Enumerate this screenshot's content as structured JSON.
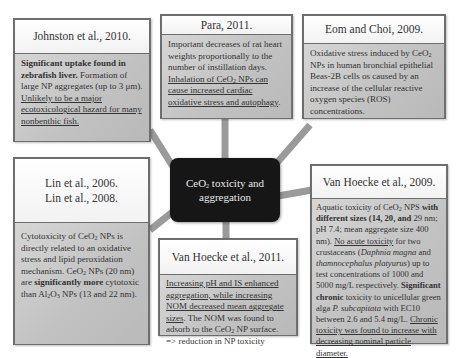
{
  "center": {
    "title_line1_prefix": "CeO",
    "title_line1_sub": "2",
    "title_line1_suffix": " toxicity and",
    "title_line2": "aggregation"
  },
  "boxes": {
    "johnston": {
      "header": "Johnston et al., 2010.",
      "body_bold": "Significant uptake found in zebrafish liver.",
      "body_plain": " Formation of large NP aggregates (up to 3 μm). ",
      "body_underline": "Unlikely to be a major ecotoxicological hazard for many nonbenthic fish."
    },
    "para": {
      "header": "Para, 2011.",
      "body_plain": "Important decreases of rat heart weights proportionally to the number of instillation days. ",
      "body_underline_prefix": "Inhalation of CeO",
      "body_underline_sub": "2",
      "body_underline_suffix": " NPs can cause increased cardiac oxidative stress and autophagy",
      "body_end": "."
    },
    "eom": {
      "header": "Eom and Choi, 2009.",
      "body_prefix": "Oxidative stress induced by CeO",
      "body_sub": "2",
      "body_suffix": " NPs in human bronchial epithelial Beas-2B cells os caused by an increase of the cellular reactive oxygen species (ROS) concentrations."
    },
    "lin": {
      "header_line1": "Lin et al., 2006.",
      "header_line2": "Lin et al., 2008.",
      "body_p1_prefix": "Cytotoxicity of CeO",
      "body_p1_sub": "2",
      "body_p1_suffix": " NPs is directly related to an oxidative stress and lipid peroxidation mechanism.",
      "body_p2_prefix": " CeO",
      "body_p2_sub": "2",
      "body_p2_mid": " NPs (20 nm) are ",
      "body_p2_bold": "significantly more",
      "body_p2_mid2": " cytotoxic than Al",
      "body_p2_sub2": "2",
      "body_p2_mid3": "O",
      "body_p2_sub3": "3",
      "body_p2_suffix": " NPs (13 and 22 nm)."
    },
    "vanhoecke2011": {
      "header": "Van Hoecke et al., 2011.",
      "body_underline": "Increasing pH and IS enhanced aggregation, while increasing NOM decreased mean aggregate sizes",
      "body_plain_prefix": ". The NOM was found to adsorb to the CeO",
      "body_plain_sub": "2",
      "body_plain_suffix": " NP surface. => reduction in NP toxicity"
    },
    "vanhoecke2009": {
      "header": "Van Hoecke et al., 2009.",
      "t1": "Aquatic toxicity of CeO",
      "t1_sub": "2",
      "t2": " NPS ",
      "t3_bold": "with different sizes (14, 20, and",
      "t4": " 29 nm; pH 7.4; mean aggregate size 400 nm). ",
      "t5_underline": "No acute toxicity",
      "t6": " for two crustaceans (",
      "t7_italic": "Daphnia magna",
      "t8": " and ",
      "t9_italic": "thamnocephalus platyurus",
      "t10": ") up to test concentrations of 1000 and 5000 mg/L respectively. ",
      "t11_bold": "Significant chronic",
      "t12": " toxicity to unicellular green alga ",
      "t13_italic": "P. subcapitata",
      "t14": " with EC10 between 2.6 and 5.4 mg/L. ",
      "t15_underline": "Chronic toxicity was found to increase with decreasing nominal particle diameter."
    }
  },
  "colors": {
    "connector": "#9a9a9a",
    "center_bg": "#161616",
    "box_border": "#6e6e6e",
    "body_bg": "#c8c8c8"
  }
}
